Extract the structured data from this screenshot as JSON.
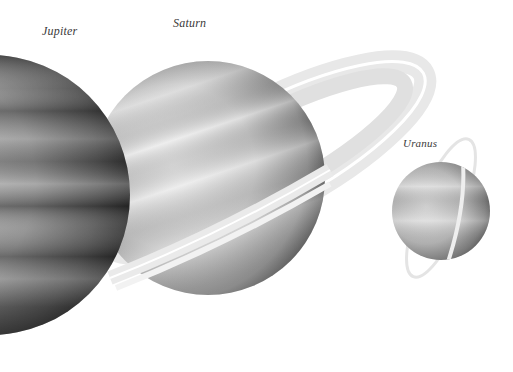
{
  "planets": [
    {
      "name": "Jupiter",
      "label": "Jupiter"
    },
    {
      "name": "Saturn",
      "label": "Saturn"
    },
    {
      "name": "Uranus",
      "label": "Uranus"
    }
  ],
  "colors": {
    "background": "#ffffff",
    "label_text": "#3a3a3a",
    "jupiter_dark": "#3c3c3c",
    "jupiter_light": "#b8b8b8",
    "saturn_light": "#e6e6e6",
    "saturn_dark": "#5a5a5a",
    "ring": "#ececec",
    "uranus_light": "#e0e0e0",
    "uranus_dark": "#6e6e6e"
  }
}
